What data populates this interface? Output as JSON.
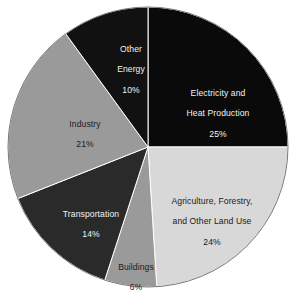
{
  "chart_data": {
    "type": "pie",
    "title": "",
    "subtitle": "",
    "xlabel": "",
    "ylabel": "",
    "legend": "none",
    "grid": false,
    "units": "percent",
    "total": 100,
    "start_angle_deg": 0,
    "direction": "clockwise",
    "categories": [
      "Electricity and Heat Production",
      "Agriculture, Forestry, and Other Land Use",
      "Buildings",
      "Transportation",
      "Industry",
      "Other Energy"
    ],
    "values": [
      25,
      24,
      6,
      14,
      21,
      10
    ],
    "slices": [
      {
        "name": "Electricity and Heat Production",
        "label_line1": "Electricity and",
        "label_line2": "Heat Production",
        "value": 25,
        "value_label": "25%",
        "color": "#0a0a0a",
        "text_color": "#f2f2f2",
        "start_deg": 0,
        "end_deg": 90
      },
      {
        "name": "Agriculture, Forestry, and Other Land Use",
        "label_line1": "Agriculture, Forestry,",
        "label_line2": "and Other Land Use",
        "value": 24,
        "value_label": "24%",
        "color": "#d8d8d8",
        "text_color": "#1a1a1a",
        "start_deg": 90,
        "end_deg": 176.4
      },
      {
        "name": "Buildings",
        "label_line1": "Buildings",
        "label_line2": "",
        "value": 6,
        "value_label": "6%",
        "color": "#9a9a9a",
        "text_color": "#1a1a1a",
        "start_deg": 176.4,
        "end_deg": 198
      },
      {
        "name": "Transportation",
        "label_line1": "Transportation",
        "label_line2": "",
        "value": 14,
        "value_label": "14%",
        "color": "#2a2a2a",
        "text_color": "#f2f2f2",
        "start_deg": 198,
        "end_deg": 248.4
      },
      {
        "name": "Industry",
        "label_line1": "Industry",
        "label_line2": "",
        "value": 21,
        "value_label": "21%",
        "color": "#9a9a9a",
        "text_color": "#1a1a1a",
        "start_deg": 248.4,
        "end_deg": 324
      },
      {
        "name": "Other Energy",
        "label_line1": "Other",
        "label_line2": "Energy",
        "value": 10,
        "value_label": "10%",
        "color": "#111111",
        "text_color": "#f2f2f2",
        "start_deg": 324,
        "end_deg": 360
      }
    ],
    "geometry": {
      "center_x": 148,
      "center_y": 147,
      "radius": 140,
      "outline_color": "#7a7a7a"
    },
    "background_color": "#ffffff"
  }
}
